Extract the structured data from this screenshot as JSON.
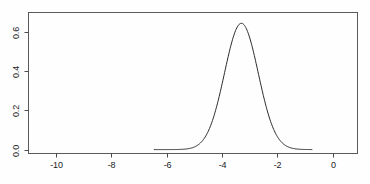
{
  "chart_data": {
    "type": "line",
    "title": "",
    "subtitle": "",
    "xlabel": "",
    "ylabel": "",
    "xlim": [
      -11.0,
      0.9
    ],
    "ylim": [
      -0.02,
      0.7
    ],
    "xticks": [
      -10,
      -8,
      -6,
      -4,
      -2,
      0
    ],
    "xticklabels": [
      "-10",
      "-8",
      "-6",
      "-4",
      "-2",
      "0"
    ],
    "yticks": [
      0.0,
      0.2,
      0.4,
      0.6
    ],
    "yticklabels": [
      "0.0",
      "0.2",
      "0.4",
      "0.6"
    ],
    "grid": false,
    "legend": null,
    "frame": "box",
    "series": [
      {
        "name": "density",
        "color": "#2b2b2b",
        "linewidth": 1,
        "distribution": "gaussian",
        "peak_x": -3.3,
        "peak_y": 0.645,
        "sigma": 0.61,
        "x_start": -6.45,
        "x_end": -0.75,
        "x": [
          -6.45,
          -6.2,
          -5.95,
          -5.7,
          -5.45,
          -5.2,
          -4.95,
          -4.7,
          -4.45,
          -4.2,
          -3.95,
          -3.7,
          -3.45,
          -3.3,
          -3.15,
          -2.9,
          -2.65,
          -2.4,
          -2.15,
          -1.9,
          -1.65,
          -1.4,
          -1.15,
          -0.9,
          -0.75
        ],
        "y": [
          0.0002,
          0.0006,
          0.0017,
          0.0043,
          0.0101,
          0.022,
          0.0444,
          0.0829,
          0.143,
          0.2279,
          0.3354,
          0.4559,
          0.5718,
          0.6256,
          0.6401,
          0.5893,
          0.4868,
          0.3648,
          0.2505,
          0.1579,
          0.0913,
          0.0485,
          0.0237,
          0.0106,
          0.0061
        ]
      }
    ]
  },
  "axis": {
    "x_tick_labels": [
      "-10",
      "-8",
      "-6",
      "-4",
      "-2",
      "0"
    ],
    "y_tick_labels": [
      "0.0",
      "0.2",
      "0.4",
      "0.6"
    ]
  }
}
